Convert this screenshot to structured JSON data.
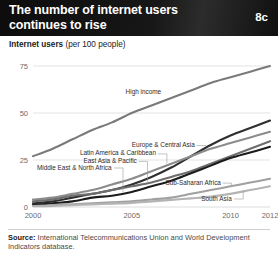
{
  "header": {
    "title_line1": "The number of internet users",
    "title_line2": "continues to rise",
    "badge": "8c"
  },
  "subtitle": {
    "bold_part": "Internet users",
    "unit_part": " (per 100 people)"
  },
  "footer": {
    "source_label": "Source:",
    "source_text": " International Telecommunications Union and World Development Indicators database."
  },
  "colors": {
    "banner": "#121212",
    "high_income": "#7a7a7a",
    "europe_central_asia": "#2f2f2f",
    "latin_america": "#8c8c8c",
    "east_asia_pacific": "#6e6e6e",
    "middle_east_north_africa": "#1c1c1c",
    "sub_saharan_africa": "#a0a0a0",
    "south_asia": "#b4b4b4",
    "grid": "#dcdcdc",
    "tick_text": "#6b6b6b"
  },
  "chart_data": {
    "type": "line",
    "title": "The number of internet users continues to rise",
    "xlabel": "",
    "ylabel": "Internet users (per 100 people)",
    "xlim": [
      2000,
      2012
    ],
    "ylim": [
      0,
      80
    ],
    "yticks": [
      0,
      25,
      50,
      75
    ],
    "xticks": [
      2000,
      2005,
      2010,
      2012
    ],
    "grid": true,
    "legend": "inline-labels",
    "x": [
      2000,
      2001,
      2002,
      2003,
      2004,
      2005,
      2006,
      2007,
      2008,
      2009,
      2010,
      2011,
      2012
    ],
    "series": [
      {
        "name": "High income",
        "color": "#7a7a7a",
        "values": [
          27,
          31,
          36,
          41,
          45,
          50,
          54,
          58,
          62,
          66,
          69,
          72,
          75
        ],
        "label_x": 2005.6,
        "label_y": 61
      },
      {
        "name": "Europe & Central Asia",
        "color": "#2f2f2f",
        "values": [
          2,
          3,
          5,
          7,
          9,
          12,
          16,
          21,
          27,
          33,
          38,
          42,
          46
        ],
        "label_x": 2006.6,
        "label_y": 33
      },
      {
        "name": "Latin America & Caribbean",
        "color": "#8c8c8c",
        "values": [
          4,
          5,
          7,
          9,
          12,
          15,
          19,
          23,
          27,
          31,
          34,
          37,
          40
        ],
        "label_x": 2004.3,
        "label_y": 28.5
      },
      {
        "name": "East Asia & Pacific",
        "color": "#6e6e6e",
        "values": [
          3,
          4,
          6,
          7,
          9,
          11,
          13,
          16,
          19,
          23,
          27,
          31,
          35
        ],
        "label_x": 2003.9,
        "label_y": 24.5
      },
      {
        "name": "Middle East & North Africa",
        "color": "#1c1c1c",
        "values": [
          1,
          2,
          3,
          5,
          6,
          8,
          11,
          14,
          18,
          22,
          26,
          29,
          32
        ],
        "label_x": 2002.1,
        "label_y": 21
      },
      {
        "name": "Sub-Saharan Africa",
        "color": "#a0a0a0",
        "values": [
          0.5,
          1,
          1.5,
          2,
          2.5,
          3,
          4,
          5,
          7,
          9,
          11,
          13,
          15
        ],
        "label_x": 2008.1,
        "label_y": 13
      },
      {
        "name": "South Asia",
        "color": "#b4b4b4",
        "values": [
          0.4,
          0.6,
          1,
          1.4,
          1.8,
          2.2,
          3,
          3.8,
          4.6,
          5.5,
          7,
          9,
          11
        ],
        "label_x": 2009.3,
        "label_y": 4.5
      }
    ]
  }
}
